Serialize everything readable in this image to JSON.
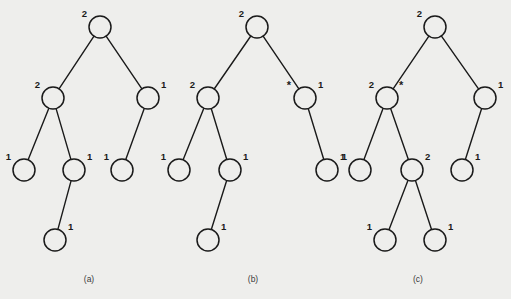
{
  "figure": {
    "background_color": "#eeeeec",
    "ink_color": "#1a1a1a",
    "node_radius": 11,
    "panels": [
      {
        "id": "a",
        "caption": "(a)",
        "caption_x": 89,
        "caption_y": 282,
        "nodes": [
          {
            "id": "a-root",
            "name": "root",
            "x": 100,
            "y": 27,
            "label": "2",
            "label_side": "left",
            "star": ""
          },
          {
            "id": "a-l",
            "name": "left-child",
            "x": 53,
            "y": 98,
            "label": "2",
            "label_side": "left",
            "star": ""
          },
          {
            "id": "a-r",
            "name": "right-child",
            "x": 148,
            "y": 98,
            "label": "1",
            "label_side": "right",
            "star": ""
          },
          {
            "id": "a-ll",
            "name": "left-left-leaf",
            "x": 24,
            "y": 170,
            "label": "1",
            "label_side": "left",
            "star": ""
          },
          {
            "id": "a-lr",
            "name": "left-right-node",
            "x": 74,
            "y": 170,
            "label": "1",
            "label_side": "right",
            "star": ""
          },
          {
            "id": "a-rl",
            "name": "right-left-leaf",
            "x": 122,
            "y": 170,
            "label": "1",
            "label_side": "left",
            "star": ""
          },
          {
            "id": "a-lrl",
            "name": "bottom-leaf",
            "x": 55,
            "y": 240,
            "label": "1",
            "label_side": "right",
            "star": ""
          }
        ],
        "edges": [
          {
            "from": "a-root",
            "to": "a-l"
          },
          {
            "from": "a-root",
            "to": "a-r"
          },
          {
            "from": "a-l",
            "to": "a-ll"
          },
          {
            "from": "a-l",
            "to": "a-lr"
          },
          {
            "from": "a-r",
            "to": "a-rl"
          },
          {
            "from": "a-lr",
            "to": "a-lrl"
          }
        ]
      },
      {
        "id": "b",
        "caption": "(b)",
        "caption_x": 253,
        "caption_y": 282,
        "nodes": [
          {
            "id": "b-root",
            "name": "root",
            "x": 257,
            "y": 27,
            "label": "2",
            "label_side": "left",
            "star": ""
          },
          {
            "id": "b-l",
            "name": "left-child",
            "x": 208,
            "y": 98,
            "label": "2",
            "label_side": "left",
            "star": ""
          },
          {
            "id": "b-r",
            "name": "right-child",
            "x": 305,
            "y": 98,
            "label": "1",
            "label_side": "right",
            "star": "*"
          },
          {
            "id": "b-ll",
            "name": "left-left-leaf",
            "x": 179,
            "y": 170,
            "label": "1",
            "label_side": "left",
            "star": ""
          },
          {
            "id": "b-lr",
            "name": "left-right-node",
            "x": 230,
            "y": 170,
            "label": "1",
            "label_side": "right",
            "star": ""
          },
          {
            "id": "b-rr",
            "name": "right-right-leaf",
            "x": 327,
            "y": 170,
            "label": "1",
            "label_side": "right",
            "star": ""
          },
          {
            "id": "b-lrl",
            "name": "bottom-leaf",
            "x": 208,
            "y": 240,
            "label": "1",
            "label_side": "right",
            "star": ""
          }
        ],
        "edges": [
          {
            "from": "b-root",
            "to": "b-l"
          },
          {
            "from": "b-root",
            "to": "b-r"
          },
          {
            "from": "b-l",
            "to": "b-ll"
          },
          {
            "from": "b-l",
            "to": "b-lr"
          },
          {
            "from": "b-r",
            "to": "b-rr"
          },
          {
            "from": "b-lr",
            "to": "b-lrl"
          }
        ]
      },
      {
        "id": "c",
        "caption": "(c)",
        "caption_x": 418,
        "caption_y": 282,
        "nodes": [
          {
            "id": "c-root",
            "name": "root",
            "x": 435,
            "y": 27,
            "label": "2",
            "label_side": "left",
            "star": ""
          },
          {
            "id": "c-l",
            "name": "left-child",
            "x": 387,
            "y": 98,
            "label": "2",
            "label_side": "left",
            "star": "*"
          },
          {
            "id": "c-r",
            "name": "right-child",
            "x": 485,
            "y": 98,
            "label": "1",
            "label_side": "right",
            "star": ""
          },
          {
            "id": "c-ll",
            "name": "left-left-leaf",
            "x": 360,
            "y": 170,
            "label": "1",
            "label_side": "left",
            "star": ""
          },
          {
            "id": "c-lr",
            "name": "left-right-node",
            "x": 412,
            "y": 170,
            "label": "2",
            "label_side": "right",
            "star": ""
          },
          {
            "id": "c-rl",
            "name": "right-left-leaf",
            "x": 462,
            "y": 170,
            "label": "1",
            "label_side": "right",
            "star": ""
          },
          {
            "id": "c-lrl",
            "name": "bottom-left-leaf",
            "x": 385,
            "y": 240,
            "label": "1",
            "label_side": "left",
            "star": ""
          },
          {
            "id": "c-lrr",
            "name": "bottom-right-leaf",
            "x": 435,
            "y": 240,
            "label": "1",
            "label_side": "right",
            "star": ""
          }
        ],
        "edges": [
          {
            "from": "c-root",
            "to": "c-l"
          },
          {
            "from": "c-root",
            "to": "c-r"
          },
          {
            "from": "c-l",
            "to": "c-ll"
          },
          {
            "from": "c-l",
            "to": "c-lr"
          },
          {
            "from": "c-r",
            "to": "c-rl"
          },
          {
            "from": "c-lr",
            "to": "c-lrl"
          },
          {
            "from": "c-lr",
            "to": "c-lrr"
          }
        ]
      }
    ]
  }
}
